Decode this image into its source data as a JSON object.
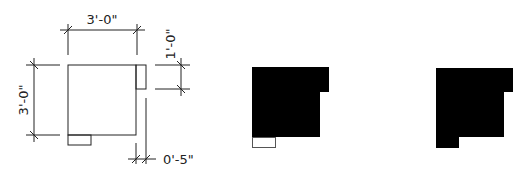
{
  "diagram": {
    "dimensions": {
      "top_width": "3'-0\"",
      "left_height": "3'-0\"",
      "right_tab": "1'-0\"",
      "bottom_offset": "0'-5\""
    },
    "colors": {
      "line": "#222222",
      "fill": "#000000",
      "background": "#ffffff"
    },
    "figures": [
      {
        "name": "dimensioned-outline"
      },
      {
        "name": "filled-with-outlined-tab"
      },
      {
        "name": "fully-filled"
      }
    ]
  }
}
